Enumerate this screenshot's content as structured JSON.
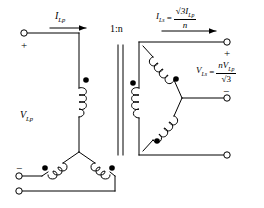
{
  "diagram": {
    "title_text": "",
    "ratio_label": "1:n",
    "primary": {
      "current_label_I": "I",
      "current_label_sub": "Lp",
      "voltage_label_V": "V",
      "voltage_label_sub": "Lp",
      "plus_sign": "+",
      "minus_sign": "−",
      "connection": "wye"
    },
    "secondary": {
      "current_label_I": "I",
      "current_label_sub": "Ls",
      "current_equals": "=",
      "current_numerator": "√3I",
      "current_numerator_sub": "Lp",
      "current_denominator": "n",
      "voltage_label_V": "V",
      "voltage_label_sub": "Ls",
      "voltage_equals": "=",
      "voltage_numerator": "nV",
      "voltage_numerator_sub": "Lp",
      "voltage_denominator": "√3",
      "plus_sign": "+",
      "minus_sign": "−",
      "connection": "delta"
    },
    "colors": {
      "line": "#000000",
      "background": "#ffffff",
      "dot": "#000000"
    }
  }
}
